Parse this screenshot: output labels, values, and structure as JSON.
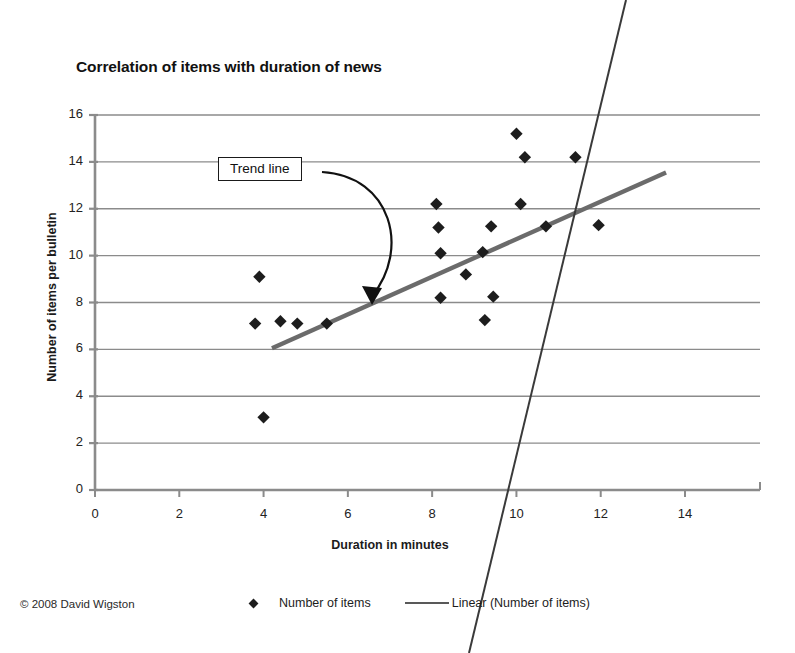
{
  "figure": {
    "copyright": "© 2008 David Wigston",
    "annotation": {
      "label": "Trend line",
      "icon": "curved-arrow-icon"
    }
  },
  "chart_data": {
    "type": "scatter",
    "title": "Correlation of items with duration of news",
    "xlabel": "Duration in minutes",
    "ylabel": "Number of items per bulletin",
    "xlim": [
      0,
      14
    ],
    "ylim": [
      0,
      16
    ],
    "xticks": [
      0,
      2,
      4,
      6,
      8,
      10,
      12,
      14
    ],
    "yticks": [
      0,
      2,
      4,
      6,
      8,
      10,
      12,
      14,
      16
    ],
    "grid": "horizontal",
    "legend_position": "bottom",
    "series": [
      {
        "name": "Number of items",
        "marker": "diamond",
        "color": "#1d1d1d",
        "points": [
          [
            3.8,
            7.1
          ],
          [
            3.9,
            9.1
          ],
          [
            4.0,
            3.1
          ],
          [
            4.4,
            7.2
          ],
          [
            4.8,
            7.1
          ],
          [
            5.5,
            7.1
          ],
          [
            8.1,
            12.2
          ],
          [
            8.15,
            11.2
          ],
          [
            8.2,
            10.1
          ],
          [
            8.2,
            8.2
          ],
          [
            8.8,
            9.2
          ],
          [
            9.2,
            10.15
          ],
          [
            9.25,
            7.25
          ],
          [
            9.4,
            11.25
          ],
          [
            9.45,
            8.25
          ],
          [
            10.0,
            15.2
          ],
          [
            10.1,
            12.2
          ],
          [
            10.2,
            14.2
          ],
          [
            10.7,
            11.25
          ],
          [
            11.4,
            14.2
          ],
          [
            11.95,
            11.3
          ]
        ]
      }
    ],
    "trendline": {
      "name": "Linear (Number of items)",
      "color": "#6b6b6b",
      "x_start": 4.2,
      "y_start": 6.05,
      "x_end": 13.55,
      "y_end": 13.55
    },
    "artifact_line": {
      "name": "scan-artifact-line",
      "color": "#3a3a3a",
      "x1_px": 626,
      "y1_px": 0,
      "x2_px": 469,
      "y2_px": 653
    }
  }
}
